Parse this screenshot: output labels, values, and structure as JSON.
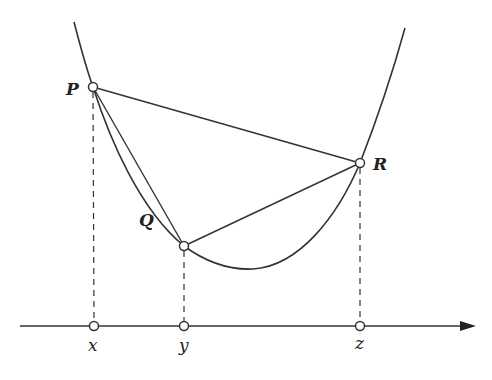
{
  "diagram": {
    "colors": {
      "stroke": "#333333",
      "background": "#ffffff"
    },
    "points": [
      {
        "id": "P",
        "label": "P",
        "cx": 93,
        "cy": 87
      },
      {
        "id": "Q",
        "label": "Q",
        "cx": 184,
        "cy": 246
      },
      {
        "id": "R",
        "label": "R",
        "cx": 360,
        "cy": 163
      }
    ],
    "axis_points": [
      {
        "id": "x",
        "label": "x",
        "cx": 94
      },
      {
        "id": "y",
        "label": "y",
        "cx": 184
      },
      {
        "id": "z",
        "label": "z",
        "cx": 360
      }
    ],
    "labels": {
      "P": "P",
      "Q": "Q",
      "R": "R",
      "x": "x",
      "y": "y",
      "z": "z"
    }
  }
}
